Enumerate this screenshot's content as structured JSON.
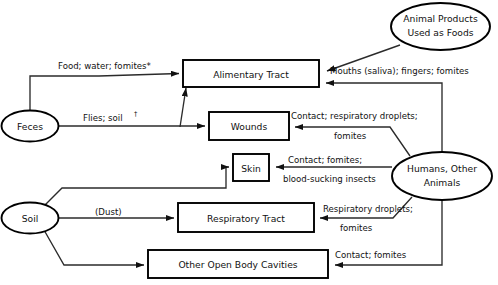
{
  "diagram": {
    "type": "flow-diagram",
    "background_color": "#ffffff",
    "stroke_color": "#000000",
    "text_color": "#111111",
    "nodes": [
      {
        "id": "animal_products",
        "shape": "ellipse",
        "lines": [
          "Animal Products",
          "Used as Foods"
        ],
        "role": "source"
      },
      {
        "id": "feces",
        "shape": "ellipse",
        "lines": [
          "Feces"
        ],
        "role": "source"
      },
      {
        "id": "soil",
        "shape": "ellipse",
        "lines": [
          "Soil"
        ],
        "role": "source"
      },
      {
        "id": "humans_other_animals",
        "shape": "ellipse",
        "lines": [
          "Humans, Other",
          "Animals"
        ],
        "role": "source"
      },
      {
        "id": "alimentary_tract",
        "shape": "rectangle",
        "lines": [
          "Alimentary Tract"
        ],
        "role": "portal-of-entry"
      },
      {
        "id": "wounds",
        "shape": "rectangle",
        "lines": [
          "Wounds"
        ],
        "role": "portal-of-entry"
      },
      {
        "id": "skin",
        "shape": "rectangle",
        "lines": [
          "Skin"
        ],
        "role": "portal-of-entry"
      },
      {
        "id": "respiratory_tract",
        "shape": "rectangle",
        "lines": [
          "Respiratory Tract"
        ],
        "role": "portal-of-entry"
      },
      {
        "id": "other_open_body_cavities",
        "shape": "rectangle",
        "lines": [
          "Other Open Body Cavities"
        ],
        "role": "portal-of-entry"
      }
    ],
    "edges": [
      {
        "id": "feces_to_alimentary",
        "from": "feces",
        "to": "alimentary_tract",
        "label_lines": [
          "Food; water; fomites*"
        ]
      },
      {
        "id": "feces_to_wounds",
        "from": "feces",
        "to": "wounds",
        "label_lines": [
          "Flies; soil†"
        ]
      },
      {
        "id": "animal_products_to_alimentary",
        "from": "animal_products",
        "to": "alimentary_tract",
        "label_lines": []
      },
      {
        "id": "humans_to_alimentary",
        "from": "humans_other_animals",
        "to": "alimentary_tract",
        "label_lines": [
          "Mouths (saliva); fingers; fomites"
        ]
      },
      {
        "id": "humans_to_wounds",
        "from": "humans_other_animals",
        "to": "wounds",
        "label_lines": [
          "Contact; respiratory droplets;",
          "fomites"
        ]
      },
      {
        "id": "humans_to_skin",
        "from": "humans_other_animals",
        "to": "skin",
        "label_lines": [
          "Contact; fomites;",
          "blood-sucking insects"
        ]
      },
      {
        "id": "humans_to_respiratory",
        "from": "humans_other_animals",
        "to": "respiratory_tract",
        "label_lines": [
          "Respiratory droplets;",
          "fomites"
        ]
      },
      {
        "id": "humans_to_cavities",
        "from": "humans_other_animals",
        "to": "other_open_body_cavities",
        "label_lines": [
          "Contact; fomites"
        ]
      },
      {
        "id": "soil_to_skin",
        "from": "soil",
        "to": "skin",
        "label_lines": []
      },
      {
        "id": "soil_to_respiratory",
        "from": "soil",
        "to": "respiratory_tract",
        "label_lines": [
          "(Dust)"
        ]
      },
      {
        "id": "soil_to_cavities",
        "from": "soil",
        "to": "other_open_body_cavities",
        "label_lines": []
      }
    ],
    "labels": {
      "food_water_fomites": "Food; water; fomites*",
      "flies_soil": "Flies; soil",
      "flies_soil_mark": "†",
      "mouths_saliva": "Mouths (saliva); fingers; fomites",
      "contact_resp_droplets": "Contact; respiratory droplets;",
      "fomites_1": "fomites",
      "contact_fomites_skin": "Contact; fomites;",
      "blood_sucking_insects": "blood-sucking insects",
      "respiratory_droplets": "Respiratory droplets;",
      "fomites_2": "fomites",
      "dust": "(Dust)",
      "contact_fomites_cavities": "Contact; fomites"
    },
    "node_text": {
      "animal_products_l1": "Animal Products",
      "animal_products_l2": "Used as Foods",
      "feces": "Feces",
      "soil": "Soil",
      "humans_l1": "Humans, Other",
      "humans_l2": "Animals",
      "alimentary_tract": "Alimentary Tract",
      "wounds": "Wounds",
      "skin": "Skin",
      "respiratory_tract": "Respiratory Tract",
      "other_open_body_cavities": "Other Open Body Cavities"
    }
  }
}
